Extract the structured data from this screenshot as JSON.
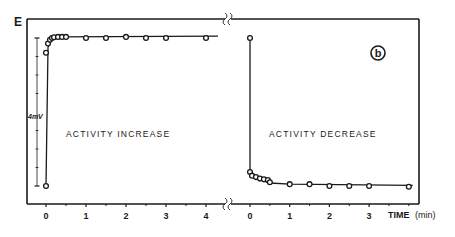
{
  "chart_data": {
    "type": "scatter",
    "title": "",
    "panel_label": "b",
    "ylabel": "E",
    "xlabel": "TIME",
    "xlabel_unit": "(min)",
    "scale_bar": {
      "label": "4mV",
      "value_mV": 4,
      "minor_ticks": 8
    },
    "grid": false,
    "legend": null,
    "panels": [
      {
        "name": "ACTIVITY INCREASE",
        "xlim": [
          -0.5,
          4.5
        ],
        "xticks": [
          0,
          1,
          2,
          3,
          4
        ],
        "xtick_labels": [
          "0",
          "1",
          "2",
          "3",
          "4"
        ],
        "minor_xticks": [
          0.5,
          1.5,
          2.5,
          3.5
        ],
        "ylim_mV": [
          0,
          4
        ],
        "x": [
          0,
          0,
          0.05,
          0.1,
          0.15,
          0.2,
          0.3,
          0.4,
          0.5,
          1,
          1.5,
          2,
          2.5,
          3,
          4
        ],
        "y_mV": [
          0,
          3.6,
          3.85,
          3.95,
          4.0,
          4.02,
          4.03,
          4.03,
          4.03,
          4.0,
          4.0,
          4.03,
          4.0,
          4.0,
          4.0
        ],
        "fit_line": [
          [
            0,
            0
          ],
          [
            0.05,
            3.75
          ],
          [
            0.15,
            3.97
          ],
          [
            0.3,
            4.03
          ],
          [
            4.3,
            4.05
          ]
        ]
      },
      {
        "name": "ACTIVITY DECREASE",
        "xlim": [
          -0.5,
          4.4
        ],
        "xticks": [
          0,
          1,
          2,
          3
        ],
        "xtick_labels": [
          "0",
          "1",
          "2",
          "3"
        ],
        "minor_xticks": [
          0.5,
          1.5,
          2.5,
          3.5,
          4
        ],
        "ylim_mV": [
          0,
          4
        ],
        "x": [
          0,
          0,
          0.05,
          0.15,
          0.25,
          0.35,
          0.45,
          0.5,
          1,
          1.5,
          2,
          2.5,
          3,
          4
        ],
        "y_mV": [
          4.0,
          0.38,
          0.28,
          0.24,
          0.2,
          0.18,
          0.16,
          0.1,
          0.05,
          0.05,
          0.0,
          0.0,
          0.0,
          -0.02
        ],
        "fit_line": [
          [
            0,
            4.0
          ],
          [
            0,
            0.35
          ],
          [
            0.1,
            0.24
          ],
          [
            0.3,
            0.16
          ],
          [
            0.5,
            0.08
          ],
          [
            1,
            0.05
          ],
          [
            4.1,
            0.02
          ]
        ]
      }
    ]
  },
  "labels": {
    "y_axis": "E",
    "panel_badge": "b",
    "scale_bar": "4mV",
    "time": "TIME",
    "time_unit": "(min)",
    "panel_left": "ACTIVITY INCREASE",
    "panel_right": "ACTIVITY DECREASE"
  }
}
